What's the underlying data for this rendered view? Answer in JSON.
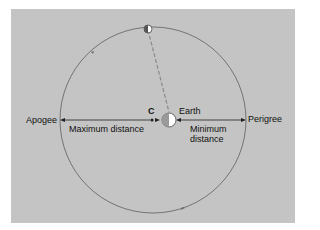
{
  "diagram": {
    "labels": {
      "apogee": "Apogee",
      "perigree": "Perigree",
      "earth": "Earth",
      "center": "C",
      "max_distance": "Maximum distance",
      "min_distance_line1": "Minimum",
      "min_distance_line2": "distance"
    },
    "colors": {
      "background": "#c4c4c4",
      "orbit": "#6a6a6a",
      "dashed_line": "#888888",
      "arrow": "#222222"
    }
  }
}
